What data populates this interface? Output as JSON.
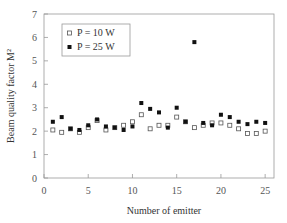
{
  "chart_data": {
    "type": "scatter",
    "title": "",
    "xlabel": "Number of emitter",
    "ylabel": "Beam quality factor M²",
    "xlim": [
      0,
      26
    ],
    "ylim": [
      0,
      7
    ],
    "xticks": [
      0,
      5,
      10,
      15,
      20,
      25
    ],
    "yticks": [
      0,
      1,
      2,
      3,
      4,
      5,
      6,
      7
    ],
    "grid": false,
    "legend_position": "upper left",
    "x": [
      1,
      2,
      3,
      4,
      5,
      6,
      7,
      8,
      9,
      10,
      11,
      12,
      13,
      14,
      15,
      16,
      17,
      18,
      19,
      20,
      21,
      22,
      23,
      24,
      25
    ],
    "series": [
      {
        "name": "P = 10 W",
        "marker": "hollow-square",
        "values": [
          2.05,
          1.95,
          2.1,
          1.95,
          2.15,
          2.45,
          2.05,
          2.15,
          2.25,
          2.4,
          2.7,
          2.1,
          2.25,
          2.25,
          2.6,
          2.4,
          2.15,
          2.25,
          2.35,
          2.35,
          2.25,
          2.1,
          1.9,
          1.9,
          2.0
        ]
      },
      {
        "name": "P = 25 W",
        "marker": "filled-square",
        "values": [
          2.4,
          2.6,
          2.1,
          2.05,
          2.25,
          2.5,
          2.2,
          2.15,
          2.05,
          2.2,
          3.2,
          2.95,
          2.8,
          2.15,
          3.0,
          2.4,
          5.8,
          2.35,
          2.25,
          2.7,
          2.6,
          2.4,
          2.3,
          2.4,
          2.35
        ]
      }
    ]
  },
  "legend": {
    "items": [
      {
        "label": "P = 10 W"
      },
      {
        "label": "P = 25 W"
      }
    ]
  }
}
